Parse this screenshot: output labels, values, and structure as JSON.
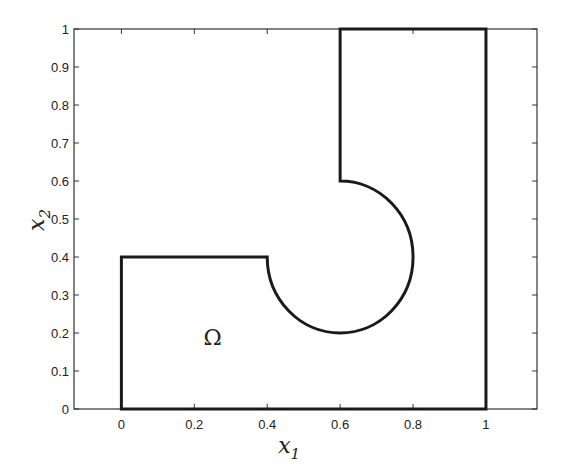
{
  "chart_data": {
    "type": "line",
    "title": "",
    "xlabel": "x1",
    "ylabel": "x2",
    "xlabel_main": "x",
    "xlabel_sub": "1",
    "ylabel_main": "x",
    "ylabel_sub": "2",
    "xlim": [
      -0.13,
      1.14
    ],
    "ylim": [
      0,
      1
    ],
    "xticks": [
      0,
      0.2,
      0.4,
      0.6,
      0.8,
      1
    ],
    "xtick_labels": [
      "0",
      "0.2",
      "0.4",
      "0.6",
      "0.8",
      "1"
    ],
    "yticks": [
      0,
      0.1,
      0.2,
      0.3,
      0.4,
      0.5,
      0.6,
      0.7,
      0.8,
      0.9,
      1
    ],
    "ytick_labels": [
      "0",
      "0.1",
      "0.2",
      "0.3",
      "0.4",
      "0.5",
      "0.6",
      "0.7",
      "0.8",
      "0.9",
      "1"
    ],
    "grid": false,
    "legend": null,
    "domain_boundary": {
      "description": "Boundary of domain Omega: square [0,1]x[0,1] with a keyhole cut (rectangular slot plus circular arc centered (0.6,0.4), radius 0.2)",
      "segments": [
        {
          "kind": "line",
          "from": [
            0,
            0
          ],
          "to": [
            1,
            0
          ]
        },
        {
          "kind": "line",
          "from": [
            1,
            0
          ],
          "to": [
            1,
            1
          ]
        },
        {
          "kind": "line",
          "from": [
            1,
            1
          ],
          "to": [
            0.6,
            1
          ]
        },
        {
          "kind": "line",
          "from": [
            0.6,
            1
          ],
          "to": [
            0.6,
            0.6
          ]
        },
        {
          "kind": "arc",
          "center": [
            0.6,
            0.4
          ],
          "radius": 0.2,
          "from": [
            0.6,
            0.6
          ],
          "to": [
            0.4,
            0.4
          ],
          "direction": "clockwise",
          "through": [
            0.8,
            0.4
          ]
        },
        {
          "kind": "line",
          "from": [
            0.4,
            0.4
          ],
          "to": [
            0,
            0.4
          ]
        },
        {
          "kind": "line",
          "from": [
            0,
            0.4
          ],
          "to": [
            0,
            0
          ]
        }
      ]
    },
    "annotations": [
      {
        "text": "Ω",
        "x": 0.25,
        "y": 0.19
      }
    ]
  },
  "style": {
    "line_color": "#1a1a1a",
    "axes_color": "#333333",
    "background": "#ffffff"
  }
}
